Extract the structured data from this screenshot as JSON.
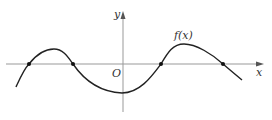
{
  "diagram": {
    "function_label": "f(x)",
    "x_axis_label": "x",
    "y_axis_label": "y",
    "origin_label": "O",
    "colors": {
      "axis": "#999999",
      "curve": "#222222",
      "text": "#333333"
    },
    "zero_points": [
      [
        29,
        64
      ],
      [
        73,
        64
      ],
      [
        161,
        64
      ],
      [
        223,
        64
      ]
    ]
  }
}
